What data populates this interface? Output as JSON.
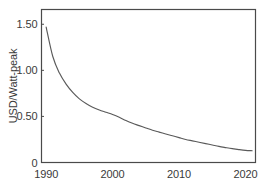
{
  "chart_data": {
    "type": "line",
    "title": "",
    "subtitle": "",
    "xlabel": "",
    "ylabel": "USD/Watt-peak",
    "xlim": [
      1989.3,
      2021.5
    ],
    "ylim": [
      0,
      1.66
    ],
    "grid": false,
    "legend_position": "none",
    "annotations": [],
    "xticks": [
      1990,
      2000,
      2010,
      2020
    ],
    "xtick_labels": [
      "1990",
      "2000",
      "2010",
      "2020"
    ],
    "yticks": [
      0,
      0.5,
      1.0,
      1.5
    ],
    "ytick_labels": [
      "0",
      "0.50",
      "1.00",
      "1.50"
    ],
    "line_color": "#555555",
    "axis_color": "#444444",
    "background_color": "#ffffff",
    "series": [
      {
        "name": "Solar module price",
        "x": [
          1990,
          1991,
          1992,
          1993,
          1994,
          1995,
          1996,
          1997,
          1998,
          1999,
          2000,
          2001,
          2002,
          2003,
          2004,
          2005,
          2006,
          2007,
          2008,
          2009,
          2010,
          2011,
          2012,
          2013,
          2014,
          2015,
          2016,
          2017,
          2018,
          2019,
          2020,
          2021
        ],
        "values": [
          1.47,
          1.15,
          0.97,
          0.85,
          0.76,
          0.69,
          0.64,
          0.6,
          0.57,
          0.545,
          0.52,
          0.49,
          0.455,
          0.425,
          0.4,
          0.375,
          0.35,
          0.33,
          0.31,
          0.29,
          0.27,
          0.25,
          0.235,
          0.22,
          0.205,
          0.19,
          0.175,
          0.162,
          0.15,
          0.14,
          0.132,
          0.128
        ]
      }
    ]
  },
  "axis_titles": {
    "y": "USD/Watt-peak"
  }
}
